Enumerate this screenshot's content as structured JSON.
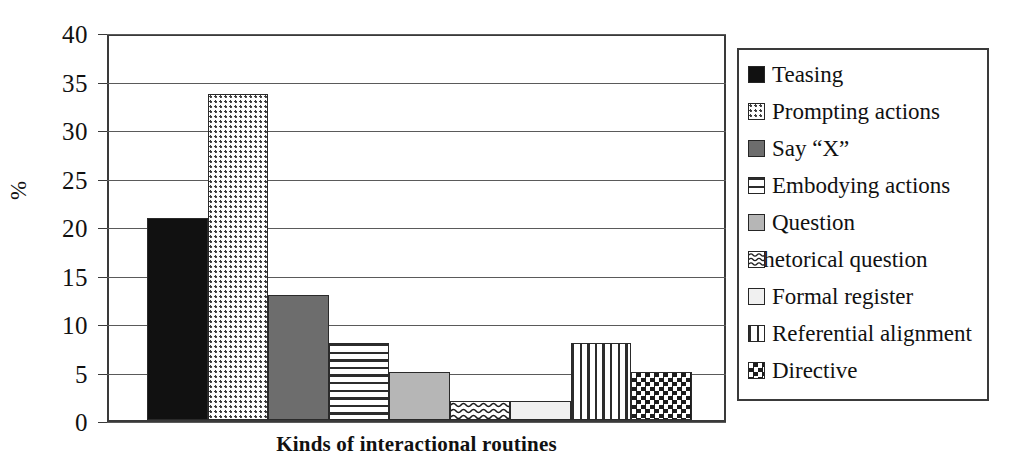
{
  "chart_data": {
    "type": "bar",
    "title": "",
    "xlabel": "Kinds of interactional routines",
    "ylabel": "%",
    "ylim": [
      0,
      40
    ],
    "ytick_labels": [
      "40",
      "35",
      "30",
      "25",
      "20",
      "15",
      "10",
      "5",
      "0"
    ],
    "ytick_values": [
      40,
      35,
      30,
      25,
      20,
      15,
      10,
      5,
      0
    ],
    "grid": true,
    "legend_position": "right",
    "categories": [
      "Teasing",
      "Prompting actions",
      "Say “X”",
      "Embodying actions",
      "Question",
      "Rhetorical question",
      "Formal register",
      "Referential alignment",
      "Directive"
    ],
    "values": [
      21,
      34,
      13,
      8,
      5,
      2,
      2,
      8,
      5
    ],
    "patterns": [
      "solid-black",
      "dotted",
      "dark-gray",
      "horizontal-lines",
      "light-gray",
      "wavy",
      "white",
      "vertical-lines",
      "checkerboard"
    ]
  },
  "legend": {
    "items": [
      {
        "label": "Teasing",
        "pattern": "solid-black"
      },
      {
        "label": "Prompting actions",
        "pattern": "dotted"
      },
      {
        "label": "Say “X”",
        "pattern": "dark-gray"
      },
      {
        "label": "Embodying actions",
        "pattern": "horizontal-lines"
      },
      {
        "label": "Question",
        "pattern": "light-gray"
      },
      {
        "label": "Rhetorical question",
        "pattern": "wavy"
      },
      {
        "label": "Formal register",
        "pattern": "white"
      },
      {
        "label": "Referential alignment",
        "pattern": "vertical-lines"
      },
      {
        "label": "Directive",
        "pattern": "checkerboard"
      }
    ]
  },
  "colors": {
    "axis": "#3a3a3a",
    "grid": "#5a5a5a",
    "text": "#111111",
    "background": "#ffffff"
  }
}
